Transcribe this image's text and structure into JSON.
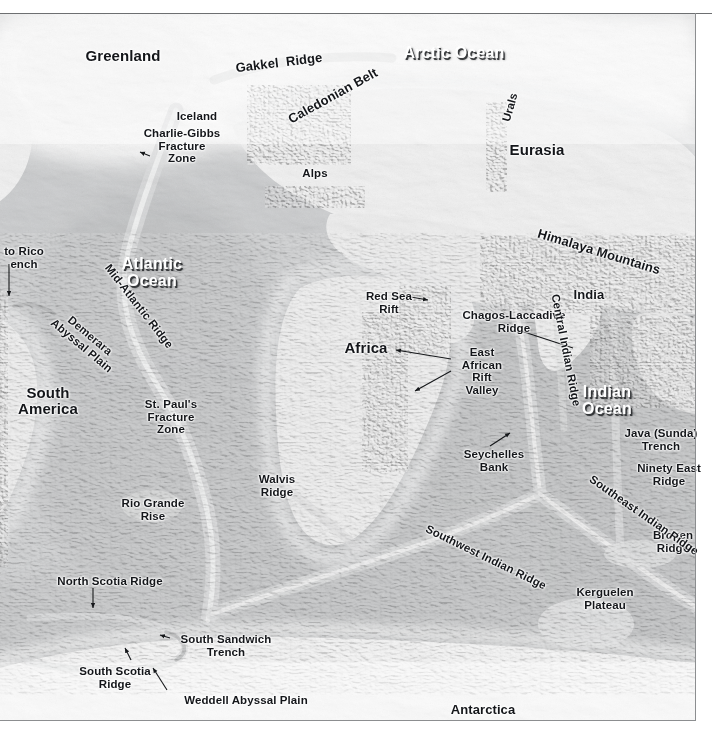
{
  "map": {
    "title": "World Ocean Floor Shaded Relief Map",
    "projection_note": "global bathymetric / topographic shaded relief, grayscale",
    "frame_color": "#8c8e90",
    "land_tone": "#e8e8e8",
    "shelf_tone": "#c9cacb",
    "deep_ocean_tone": "#a9abad",
    "ice_tone": "#f4f4f4"
  },
  "ocean_labels": [
    {
      "id": "arctic-ocean",
      "text": "Arctic Ocean",
      "x": 394,
      "y": 44,
      "w": 120,
      "rot": 0
    },
    {
      "id": "atlantic-ocean",
      "text": "Atlantic\nOcean",
      "x": 96,
      "y": 255,
      "w": 112,
      "rot": 0
    },
    {
      "id": "indian-ocean",
      "text": "Indian\nOcean",
      "x": 561,
      "y": 383,
      "w": 92,
      "rot": 0
    }
  ],
  "landmass_labels": [
    {
      "id": "greenland",
      "text": "Greenland",
      "x": 69,
      "y": 48,
      "w": 108,
      "rot": 0,
      "size": "big"
    },
    {
      "id": "eurasia",
      "text": "Eurasia",
      "x": 494,
      "y": 142,
      "w": 86,
      "rot": 0,
      "size": "big"
    },
    {
      "id": "south-america",
      "text": "South\nAmerica",
      "x": 2,
      "y": 385,
      "w": 92,
      "rot": 0,
      "size": "big"
    },
    {
      "id": "africa",
      "text": "Africa",
      "x": 331,
      "y": 340,
      "w": 70,
      "rot": 0,
      "size": "big"
    },
    {
      "id": "india",
      "text": "India",
      "x": 565,
      "y": 288,
      "w": 48,
      "rot": 0,
      "size": "med"
    },
    {
      "id": "antarctica",
      "text": "Antarctica",
      "x": 437,
      "y": 703,
      "w": 92,
      "rot": 0,
      "size": "med"
    },
    {
      "id": "iceland",
      "text": "Iceland",
      "x": 168,
      "y": 110,
      "w": 58,
      "rot": 0,
      "size": ""
    }
  ],
  "feature_labels": [
    {
      "id": "gakkel-ridge",
      "text": "Gakkel  Ridge",
      "x": 231,
      "y": 56,
      "w": 96,
      "rot": -7,
      "size": "med"
    },
    {
      "id": "caledonian-belt",
      "text": "Caledonian Belt",
      "x": 277,
      "y": 89,
      "w": 112,
      "rot": -29,
      "size": "med"
    },
    {
      "id": "urals",
      "text": "Urals",
      "x": 489,
      "y": 101,
      "w": 42,
      "rot": -74,
      "size": ""
    },
    {
      "id": "alps",
      "text": "Alps",
      "x": 297,
      "y": 167,
      "w": 36,
      "rot": 0,
      "size": ""
    },
    {
      "id": "charlie-gibbs-fz",
      "text": "Charlie-Gibbs\nFracture\nZone",
      "x": 136,
      "y": 127,
      "w": 92,
      "rot": 0,
      "size": ""
    },
    {
      "id": "puerto-rico-trench",
      "text": "to Rico\nench",
      "x": -2,
      "y": 245,
      "w": 52,
      "rot": 0,
      "size": ""
    },
    {
      "id": "mid-atlantic-ridge",
      "text": "Mid-Atlantic Ridge",
      "x": 79,
      "y": 300,
      "w": 120,
      "rot": 52,
      "size": ""
    },
    {
      "id": "demerara-abyssal-plain",
      "text": "Demerara\nAbyssal Plain",
      "x": 41,
      "y": 328,
      "w": 90,
      "rot": 40,
      "size": ""
    },
    {
      "id": "st-pauls-fz",
      "text": "St. Paul's\nFracture\nZone",
      "x": 134,
      "y": 398,
      "w": 74,
      "rot": 0,
      "size": ""
    },
    {
      "id": "rio-grande-rise",
      "text": "Rio Grande\nRise",
      "x": 113,
      "y": 497,
      "w": 80,
      "rot": 0,
      "size": ""
    },
    {
      "id": "walvis-ridge",
      "text": "Walvis\nRidge",
      "x": 249,
      "y": 473,
      "w": 56,
      "rot": 0,
      "size": ""
    },
    {
      "id": "north-scotia-ridge",
      "text": "North Scotia Ridge",
      "x": 45,
      "y": 575,
      "w": 130,
      "rot": 0,
      "size": ""
    },
    {
      "id": "south-sandwich-trench",
      "text": "South Sandwich\nTrench",
      "x": 175,
      "y": 633,
      "w": 102,
      "rot": 0,
      "size": ""
    },
    {
      "id": "south-scotia-ridge",
      "text": "South Scotia\nRidge",
      "x": 73,
      "y": 665,
      "w": 84,
      "rot": 0,
      "size": ""
    },
    {
      "id": "weddell-abyssal-plain",
      "text": "Weddell Abyssal Plain",
      "x": 171,
      "y": 694,
      "w": 150,
      "rot": 0,
      "size": ""
    },
    {
      "id": "red-sea-rift",
      "text": "Red Sea\nRift",
      "x": 358,
      "y": 290,
      "w": 62,
      "rot": 0,
      "size": ""
    },
    {
      "id": "chagos-laccadive-ridge",
      "text": "Chagos-Laccadive\nRidge",
      "x": 455,
      "y": 309,
      "w": 118,
      "rot": 0,
      "size": ""
    },
    {
      "id": "east-african-rift-valley",
      "text": "East\nAfrican\nRift\nValley",
      "x": 455,
      "y": 346,
      "w": 54,
      "rot": 0,
      "size": ""
    },
    {
      "id": "seychelles-bank",
      "text": "Seychelles\nBank",
      "x": 456,
      "y": 448,
      "w": 76,
      "rot": 0,
      "size": ""
    },
    {
      "id": "central-indian-ridge",
      "text": "Central Indian Ridge",
      "x": 503,
      "y": 344,
      "w": 126,
      "rot": 79,
      "size": ""
    },
    {
      "id": "himalaya-mountains",
      "text": "Himalaya Mountains",
      "x": 534,
      "y": 245,
      "w": 130,
      "rot": 17,
      "size": "med"
    },
    {
      "id": "java-sunda-trench",
      "text": "Java (Sunda)\nTrench",
      "x": 617,
      "y": 427,
      "w": 88,
      "rot": 0,
      "size": ""
    },
    {
      "id": "ninety-east-ridge",
      "text": "Ninety East\nRidge",
      "x": 630,
      "y": 462,
      "w": 78,
      "rot": 0,
      "size": ""
    },
    {
      "id": "broken-ridge",
      "text": "Broken\nRidge",
      "x": 644,
      "y": 529,
      "w": 58,
      "rot": 0,
      "size": ""
    },
    {
      "id": "kerguelen-plateau",
      "text": "Kerguelen\nPlateau",
      "x": 567,
      "y": 586,
      "w": 76,
      "rot": 0,
      "size": ""
    },
    {
      "id": "southwest-indian-ridge",
      "text": "Southwest Indian Ridge",
      "x": 412,
      "y": 551,
      "w": 148,
      "rot": 26,
      "size": ""
    },
    {
      "id": "southeast-indian-ridge",
      "text": "Southeast Indian Ridge",
      "x": 572,
      "y": 509,
      "w": 144,
      "rot": 35,
      "size": ""
    }
  ],
  "leaders": [
    {
      "id": "leader-puerto-rico-trench",
      "type": "arrow",
      "x1": 9,
      "y1": 264,
      "x2": 9,
      "y2": 296
    },
    {
      "id": "leader-red-sea-rift",
      "type": "arrow",
      "x1": 405,
      "y1": 296,
      "x2": 428,
      "y2": 300
    },
    {
      "id": "leader-chagos-laccadive",
      "type": "line",
      "x1": 518,
      "y1": 330,
      "x2": 573,
      "y2": 348
    },
    {
      "id": "leader-east-african-1",
      "type": "arrow",
      "x1": 451,
      "y1": 359,
      "x2": 396,
      "y2": 350
    },
    {
      "id": "leader-east-african-2",
      "type": "arrow",
      "x1": 451,
      "y1": 371,
      "x2": 415,
      "y2": 391
    },
    {
      "id": "leader-seychelles-bank",
      "type": "arrow",
      "x1": 490,
      "y1": 446,
      "x2": 510,
      "y2": 433
    },
    {
      "id": "leader-north-scotia",
      "type": "arrow",
      "x1": 93,
      "y1": 588,
      "x2": 93,
      "y2": 608
    },
    {
      "id": "leader-south-sandwich",
      "type": "arrow",
      "x1": 170,
      "y1": 638,
      "x2": 160,
      "y2": 635
    },
    {
      "id": "leader-south-scotia",
      "type": "arrow",
      "x1": 131,
      "y1": 660,
      "x2": 125,
      "y2": 648
    },
    {
      "id": "leader-weddell",
      "type": "arrow",
      "x1": 167,
      "y1": 690,
      "x2": 153,
      "y2": 668
    },
    {
      "id": "leader-charlie-gibbs",
      "type": "arrow",
      "x1": 150,
      "y1": 156,
      "x2": 140,
      "y2": 152
    }
  ]
}
